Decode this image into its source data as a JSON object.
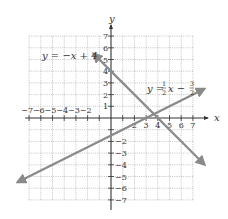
{
  "chart_data": {
    "type": "line",
    "title": "",
    "xlabel": "x",
    "ylabel": "y",
    "xlim": [
      -7,
      7
    ],
    "ylim": [
      -7,
      7
    ],
    "grid": true,
    "x_ticks": [
      -7,
      -6,
      -5,
      -4,
      -3,
      -2,
      1,
      2,
      3,
      4,
      5,
      6,
      7
    ],
    "x_tick_labels": [
      "−7",
      "−6",
      "−5",
      "−4",
      "−3",
      "−2",
      "",
      "2",
      "3",
      "4",
      "5",
      "6",
      "7"
    ],
    "y_ticks": [
      7,
      6,
      5,
      4,
      3,
      2,
      1,
      -2,
      -3,
      -4,
      -5,
      -6,
      -7
    ],
    "y_tick_labels": [
      "7",
      "6",
      "5",
      "4",
      "3",
      "2",
      "1",
      "−2",
      "−3",
      "−4",
      "−5",
      "−6",
      "−7"
    ],
    "series": [
      {
        "name": "y = −x + 4",
        "equation": "y = -x + 4",
        "slope": -1,
        "intercept": 4,
        "x": [
          -1.5,
          8.0
        ],
        "y": [
          5.5,
          -4.0
        ],
        "label_position": [
          -4.5,
          4.5
        ],
        "color": "#8a8a8a"
      },
      {
        "name": "y = ½x − 3/2",
        "equation": "y = (1/2)x - 3/2",
        "slope": 0.5,
        "intercept": -1.5,
        "x": [
          -8.0,
          8.0
        ],
        "y": [
          -5.5,
          2.5
        ],
        "label_position": [
          4.0,
          1.0
        ],
        "color": "#8a8a8a"
      }
    ],
    "intersection": {
      "x": 3.67,
      "y": 0.33
    }
  },
  "labels": {
    "x_axis": "x",
    "y_axis": "y",
    "line1_prefix": "y = −x + 4",
    "line2_prefix": "y = ",
    "line2_frac1_num": "1",
    "line2_frac1_den": "2",
    "line2_mid": "x − ",
    "line2_frac2_num": "3",
    "line2_frac2_den": "2"
  }
}
